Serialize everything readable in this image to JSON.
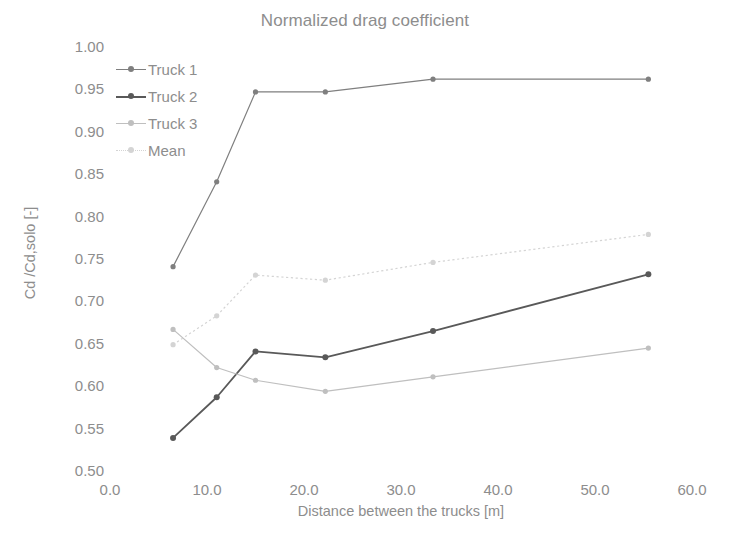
{
  "chart_data": {
    "type": "line",
    "title": "Normalized drag coefficient",
    "xlabel": "Distance between the trucks [m]",
    "ylabel": "Cd /Cd,solo [-]",
    "xlim": [
      0.0,
      60.0
    ],
    "ylim": [
      0.5,
      1.0
    ],
    "xticks": [
      "0.0",
      "10.0",
      "20.0",
      "30.0",
      "40.0",
      "50.0",
      "60.0"
    ],
    "xtick_values": [
      0.0,
      10.0,
      20.0,
      30.0,
      40.0,
      50.0,
      60.0
    ],
    "yticks": [
      "0.50",
      "0.55",
      "0.60",
      "0.65",
      "0.70",
      "0.75",
      "0.80",
      "0.85",
      "0.90",
      "0.95",
      "1.00"
    ],
    "ytick_values": [
      0.5,
      0.55,
      0.6,
      0.65,
      0.7,
      0.75,
      0.8,
      0.85,
      0.9,
      0.95,
      1.0
    ],
    "grid": false,
    "legend_position": "upper-left-inside",
    "x": [
      6.5,
      11.0,
      15.0,
      22.2,
      33.3,
      55.5
    ],
    "series": [
      {
        "name": "Truck 1",
        "color": "#7f7f7f",
        "line_style": "solid",
        "marker": "circle",
        "values": [
          0.741,
          0.841,
          0.947,
          0.947,
          0.962,
          0.962
        ]
      },
      {
        "name": "Truck 2",
        "color": "#595959",
        "line_style": "solid",
        "marker": "circle",
        "values": [
          0.539,
          0.587,
          0.641,
          0.634,
          0.665,
          0.732
        ]
      },
      {
        "name": "Truck 3",
        "color": "#bfbfbf",
        "line_style": "solid",
        "marker": "circle",
        "values": [
          0.667,
          0.622,
          0.607,
          0.594,
          0.611,
          0.645
        ]
      },
      {
        "name": "Mean",
        "color": "#d4d4d4",
        "line_style": "dotted",
        "marker": "circle",
        "values": [
          0.649,
          0.683,
          0.731,
          0.725,
          0.746,
          0.779
        ]
      }
    ]
  }
}
